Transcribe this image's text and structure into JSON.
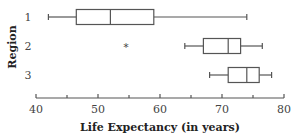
{
  "chart_data": {
    "type": "boxplot",
    "orientation": "horizontal",
    "title": "",
    "xlabel": "Life Expectancy (in years)",
    "ylabel": "Region",
    "xlim": [
      40,
      80
    ],
    "xticks": [
      40,
      50,
      60,
      70,
      80
    ],
    "minor_xticks": [
      45,
      55,
      65,
      75
    ],
    "grid": false,
    "categories": [
      "1",
      "2",
      "3"
    ],
    "series": [
      {
        "name": "1",
        "min": 42,
        "q1": 46.5,
        "median": 52,
        "q3": 59,
        "max": 74,
        "outliers": []
      },
      {
        "name": "2",
        "min": 64,
        "q1": 67,
        "median": 71,
        "q3": 73,
        "max": 76.5,
        "outliers": [
          54.5
        ]
      },
      {
        "name": "3",
        "min": 68,
        "q1": 71,
        "median": 74,
        "q3": 76,
        "max": 78,
        "outliers": []
      }
    ],
    "outlier_marker": "*"
  }
}
